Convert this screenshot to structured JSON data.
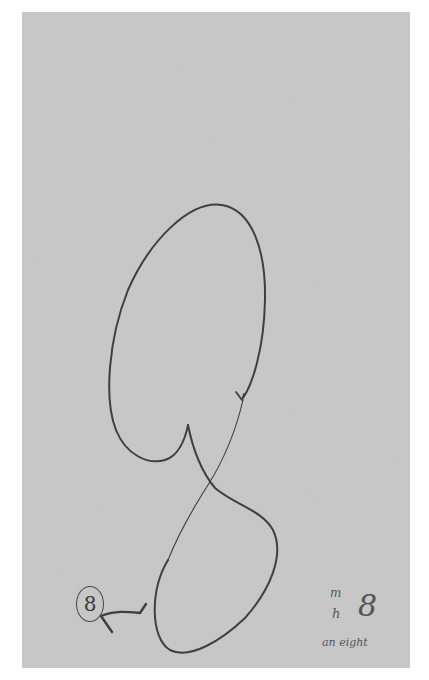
{
  "artwork": {
    "paper_color": "#c9c9c9",
    "ink_color": "#3f3f3f",
    "circled_label": "8",
    "notes": {
      "line1": "m",
      "line2": "h",
      "digit": "8",
      "caption": "an eight"
    }
  }
}
